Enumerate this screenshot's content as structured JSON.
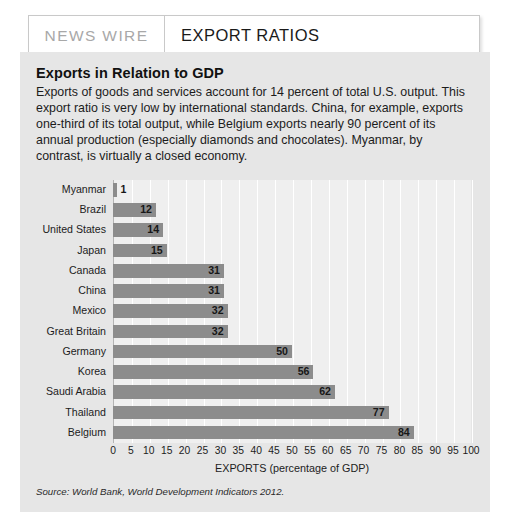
{
  "header": {
    "kicker": "NEWS WIRE",
    "title": "EXPORT RATIOS"
  },
  "article": {
    "heading": "Exports in Relation to GDP",
    "paragraph": "Exports of goods and services account for 14 percent of total U.S. output. This export ratio is very low by international standards. China, for example, exports one-third of its total output, while Belgium exports nearly 90 percent of its annual production (especially diamonds and chocolates). Myanmar, by contrast, is virtually a closed economy."
  },
  "source": "Source: World Bank, World Development Indicators 2012.",
  "colors": {
    "bar": "#8c8c8c",
    "panel": "#e6e6e6",
    "plot_background": "#efefef",
    "gridline": "#ffffff",
    "kicker_text": "#a8a8a8"
  },
  "chart_data": {
    "type": "bar",
    "orientation": "horizontal",
    "title": "Exports in Relation to GDP",
    "xlabel": "EXPORTS (percentage of GDP)",
    "ylabel": "",
    "xlim": [
      0,
      100
    ],
    "xticks": [
      0,
      5,
      10,
      15,
      20,
      25,
      30,
      35,
      40,
      45,
      50,
      55,
      60,
      65,
      70,
      75,
      80,
      85,
      90,
      95,
      100
    ],
    "grid": "vertical",
    "legend": "none",
    "categories": [
      "Myanmar",
      "Brazil",
      "United States",
      "Japan",
      "Canada",
      "China",
      "Mexico",
      "Great Britain",
      "Germany",
      "Korea",
      "Saudi Arabia",
      "Thailand",
      "Belgium"
    ],
    "values": [
      1,
      12,
      14,
      15,
      31,
      31,
      32,
      32,
      50,
      56,
      62,
      77,
      84
    ],
    "data_labels": [
      "1",
      "12",
      "14",
      "15",
      "31",
      "31",
      "32",
      "32",
      "50",
      "56",
      "62",
      "77",
      "84"
    ]
  }
}
